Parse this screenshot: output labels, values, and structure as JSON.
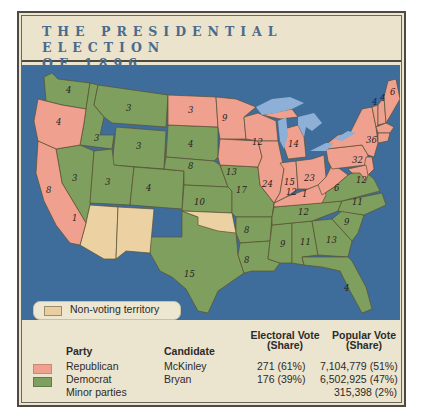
{
  "title": {
    "line1": "THE PRESIDENTIAL ELECTION",
    "line2": "OF 1896"
  },
  "colors": {
    "republican": "#efa08f",
    "democrat": "#7e9f5e",
    "non_voting": "#ecd2a3",
    "ocean": "#3e6c9b",
    "lakes": "#8fb0d6",
    "title_text": "#4a6b8c",
    "panel": "#ebe4cf"
  },
  "map_legend": {
    "non_voting_label": "Non-voting territory"
  },
  "states": {
    "WA": "4",
    "OR": "4",
    "CA": "8",
    "CA_D": "1",
    "ID": "3",
    "NV": "3",
    "MT": "3",
    "WY": "3",
    "UT": "3",
    "CO": "4",
    "ND": "3",
    "SD": "4",
    "NE": "8",
    "KS": "10",
    "TX": "15",
    "MN": "9",
    "IA": "13",
    "MO": "17",
    "AR": "8",
    "LA": "8",
    "WI": "12",
    "IL": "24",
    "MI": "14",
    "IN": "15",
    "OH": "23",
    "KY": "12",
    "KY_D": "1",
    "TN": "12",
    "MS": "9",
    "AL": "11",
    "GA": "13",
    "FL": "4",
    "SC": "9",
    "NC": "11",
    "VA": "12",
    "WV": "6",
    "PA": "32",
    "NY": "36",
    "VT": "4",
    "NH": "4",
    "ME": "6",
    "MA": "15",
    "RI": "4",
    "CT": "6",
    "NJ": "10",
    "DE": "3",
    "MD": "8"
  },
  "table": {
    "headers": {
      "party": "Party",
      "candidate": "Candidate",
      "electoral_line1": "Electoral Vote",
      "electoral_line2": "(Share)",
      "popular_line1": "Popular Vote",
      "popular_line2": "(Share)"
    },
    "rows": [
      {
        "party": "Republican",
        "candidate": "McKinley",
        "electoral": "271 (61%)",
        "popular": "7,104,779 (51%)"
      },
      {
        "party": "Democrat",
        "candidate": "Bryan",
        "electoral": "176 (39%)",
        "popular": "6,502,925 (47%)"
      },
      {
        "party": "Minor parties",
        "candidate": "",
        "electoral": "",
        "popular": "315,398 (2%)"
      }
    ]
  }
}
